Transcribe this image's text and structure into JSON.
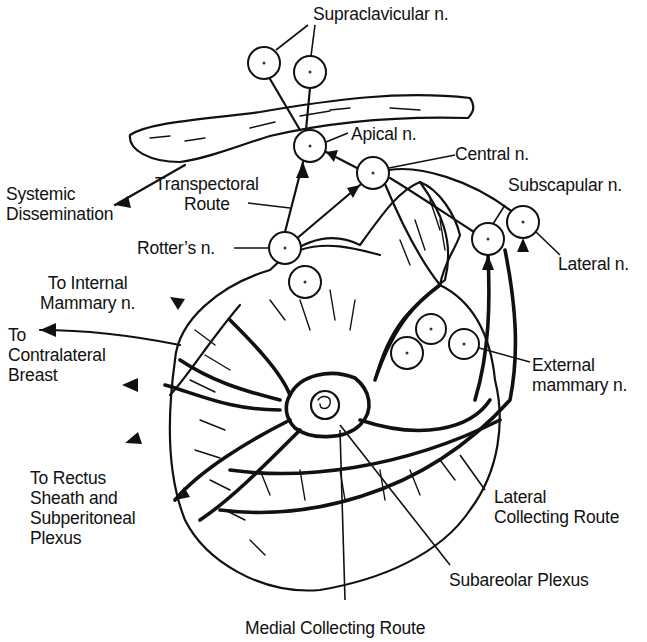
{
  "figure": {
    "colors": {
      "ink": "#111111",
      "background": "#ffffff"
    }
  },
  "labels": {
    "supraclavicular": "Supraclavicular n.",
    "apical": "Apical n.",
    "central": "Central n.",
    "subscapular": "Subscapular n.",
    "lateral": "Lateral n.",
    "systemic": "Systemic\nDissemination",
    "transpectoral": "Transpectoral\nRoute",
    "rotters": "Rotter’s n.",
    "internal_mammary": "To Internal\nMammary n.",
    "contralateral": "To\nContralateral\nBreast",
    "external_mammary": "External\nmammary n.",
    "rectus": "To Rectus\nSheath and\nSubperitoneal\nPlexus",
    "lateral_route": "Lateral\nCollecting Route",
    "subareolar": "Subareolar Plexus",
    "medial_route": "Medial Collecting Route"
  },
  "nodes": [
    {
      "id": "supraclavicular-1",
      "cx": 264,
      "cy": 63,
      "r": 16
    },
    {
      "id": "supraclavicular-2",
      "cx": 310,
      "cy": 72,
      "r": 16
    },
    {
      "id": "apical",
      "cx": 310,
      "cy": 146,
      "r": 16
    },
    {
      "id": "central",
      "cx": 373,
      "cy": 173,
      "r": 16
    },
    {
      "id": "rotters-1",
      "cx": 285,
      "cy": 248,
      "r": 16
    },
    {
      "id": "rotters-2",
      "cx": 305,
      "cy": 282,
      "r": 16
    },
    {
      "id": "subscapular",
      "cx": 488,
      "cy": 239,
      "r": 16
    },
    {
      "id": "lateral",
      "cx": 523,
      "cy": 222,
      "r": 16
    },
    {
      "id": "external-mammary-1",
      "cx": 431,
      "cy": 329,
      "r": 15
    },
    {
      "id": "external-mammary-2",
      "cx": 407,
      "cy": 353,
      "r": 16
    },
    {
      "id": "external-mammary-3",
      "cx": 464,
      "cy": 344,
      "r": 15
    }
  ]
}
